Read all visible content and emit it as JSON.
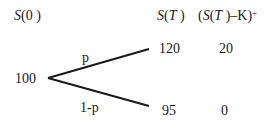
{
  "headers": {
    "s0": {
      "var": "S",
      "arg": "(0 )"
    },
    "st": {
      "var": "S",
      "arg_open": "(",
      "arg_var": "T",
      "arg_close": " )"
    },
    "payoff": {
      "open": "(",
      "var": "S",
      "arg_open": "(",
      "arg_var": "T",
      "rest": " )–K)",
      "sup": "+"
    }
  },
  "tree": {
    "root": "100",
    "up_prob": "p",
    "down_prob": "1-p",
    "up_value": "120",
    "down_value": "95",
    "up_payoff": "20",
    "down_payoff": "0"
  },
  "colors": {
    "line": "#1a1a1a",
    "text": "#1a1a1a"
  }
}
